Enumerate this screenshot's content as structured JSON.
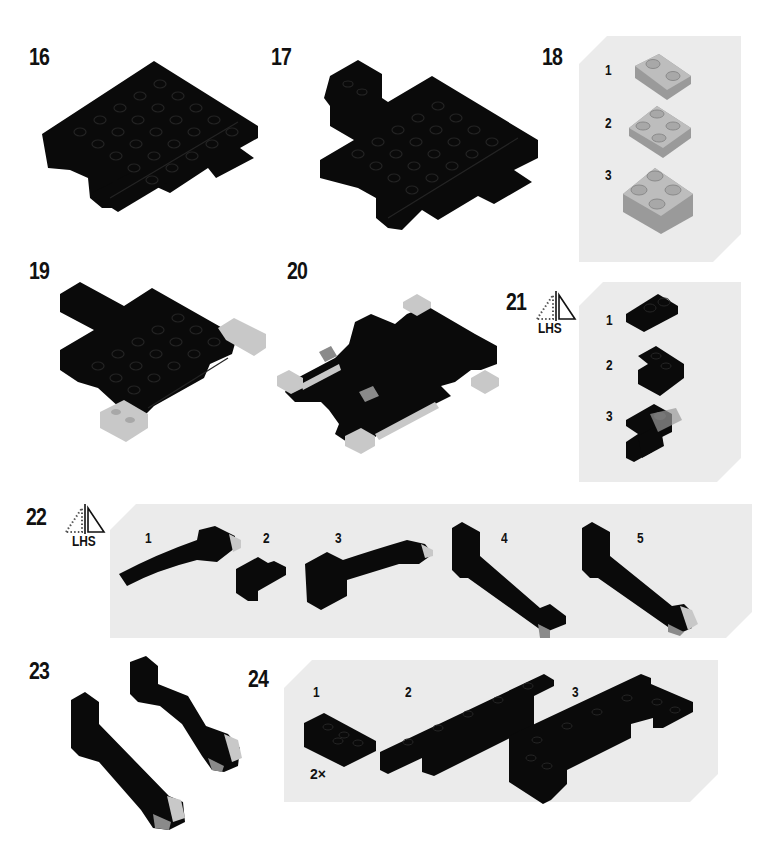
{
  "page": {
    "type": "building-instructions",
    "background": "#ffffff",
    "panel_color": "#ebebeb",
    "brick_colors": {
      "black": "#0a0a0a",
      "light_gray": "#c8c8c8",
      "mid_gray": "#9a9a9a",
      "stud_outline": "#262626"
    }
  },
  "steps": [
    {
      "number": "16",
      "description": "black plate assembly"
    },
    {
      "number": "17",
      "description": "black plate assembly with arm extension"
    },
    {
      "number": "18",
      "sub_steps": [
        {
          "number": "1"
        },
        {
          "number": "2"
        },
        {
          "number": "3"
        }
      ],
      "description": "light gray 2x2 corner sub-assembly"
    },
    {
      "number": "19",
      "description": "assembly with light gray corner pieces"
    },
    {
      "number": "20",
      "description": "flipped assembly with light gray corner pieces"
    },
    {
      "number": "21",
      "mirror_icon": "mirror-lhs-icon",
      "mirror_label": "LHS",
      "sub_steps": [
        {
          "number": "1"
        },
        {
          "number": "2"
        },
        {
          "number": "3"
        }
      ],
      "description": "black bracket sub-assembly"
    },
    {
      "number": "22",
      "mirror_icon": "mirror-lhs-icon",
      "mirror_label": "LHS",
      "sub_steps": [
        {
          "number": "1"
        },
        {
          "number": "2"
        },
        {
          "number": "3"
        },
        {
          "number": "4"
        },
        {
          "number": "5"
        }
      ],
      "description": "curved arm sub-assembly"
    },
    {
      "number": "23",
      "description": "two finished arms"
    },
    {
      "number": "24",
      "sub_steps": [
        {
          "number": "1",
          "multiplier": "2×"
        },
        {
          "number": "2"
        },
        {
          "number": "3"
        }
      ],
      "description": "black plate rail sub-assembly"
    }
  ]
}
